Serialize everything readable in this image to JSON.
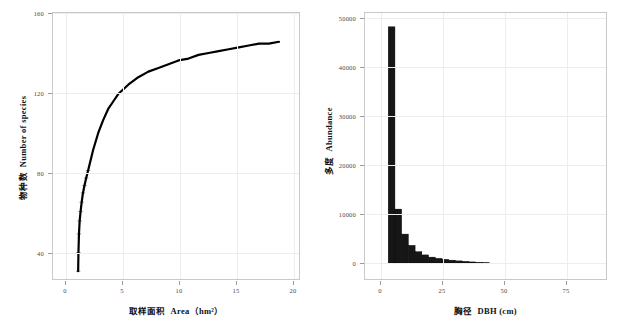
{
  "figure": {
    "background": "#ffffff",
    "axis_color": "#c9c9c9",
    "grid_color": "#ededed",
    "ink_color": "#000000"
  },
  "panels": [
    {
      "id": "species-area-curve",
      "axis_title_x_cjk": "取样面积",
      "axis_title_x_latin": "Area（hm²）",
      "axis_title_y_cjk": "物种数",
      "axis_title_y_latin": "Number of species",
      "y_ticklabels": [
        "160",
        "120",
        "80",
        "40"
      ],
      "x_ticklabels": [
        "0",
        "5",
        "10",
        "15",
        "20"
      ]
    },
    {
      "id": "dbh-abundance-histogram",
      "axis_title_x_cjk": "胸径",
      "axis_title_x_latin": "DBH (cm)",
      "axis_title_y_cjk": "多度",
      "axis_title_y_latin": "Abundance",
      "y_ticklabels": [
        "50000",
        "40000",
        "30000",
        "20000",
        "10000",
        "0"
      ],
      "x_ticklabels": [
        "0",
        "25",
        "50",
        "75"
      ]
    }
  ],
  "chart_data": [
    {
      "type": "line",
      "title": "",
      "xlabel": "取样面积  Area（hm²）",
      "ylabel": "物种数  Number of species",
      "xlim": [
        -1.2,
        21.5
      ],
      "ylim": [
        28,
        162
      ],
      "xticks": [
        0,
        5,
        10,
        15,
        20
      ],
      "yticks": [
        40,
        80,
        120,
        160
      ],
      "grid": true,
      "legend": "none",
      "series": [
        {
          "name": "Species accumulation",
          "x": [
            0.01,
            0.04,
            0.09,
            0.16,
            0.25,
            0.36,
            0.49,
            0.64,
            0.81,
            1.0,
            1.5,
            2.0,
            2.5,
            3.0,
            3.5,
            4.0,
            5.0,
            6.0,
            7.0,
            8.0,
            9.0,
            10.0,
            11.0,
            12.0,
            13.0,
            14.0,
            15.0,
            16.0,
            17.0,
            18.0,
            19.0,
            20.0
          ],
          "y": [
            30,
            40,
            50,
            57,
            62,
            67,
            72,
            76,
            80,
            84,
            95,
            104,
            111,
            117,
            121,
            125,
            130,
            134,
            137,
            139,
            141,
            143,
            144,
            146,
            147,
            148,
            149,
            150,
            151,
            152,
            152,
            153
          ]
        }
      ]
    },
    {
      "type": "bar",
      "title": "",
      "xlabel": "胸径  DBH (cm)",
      "ylabel": "多度  Abundance",
      "xlim": [
        -2,
        90
      ],
      "ylim": [
        0,
        50000
      ],
      "xticks": [
        0,
        25,
        50,
        75
      ],
      "yticks": [
        0,
        10000,
        20000,
        30000,
        40000,
        50000
      ],
      "grid": true,
      "legend": "none",
      "bin_width": 2.8,
      "categories": [
        "1.0-3.8",
        "3.8-6.6",
        "6.6-9.4",
        "9.4-12.2",
        "12.2-15.0",
        "15.0-17.8",
        "17.8-20.6",
        "20.6-23.4",
        "23.4-26.2",
        "26.2-29.0",
        "29.0-31.8",
        "31.8-34.6",
        "34.6-37.4",
        "37.4-40.2",
        "40.2-43.0"
      ],
      "x": [
        2.4,
        5.2,
        8.0,
        10.8,
        13.6,
        16.4,
        19.2,
        22.0,
        24.8,
        27.6,
        30.4,
        33.2,
        36.0,
        38.8,
        41.6
      ],
      "values": [
        48200,
        11000,
        5900,
        3600,
        2300,
        1650,
        1200,
        950,
        750,
        580,
        430,
        330,
        220,
        130,
        60
      ]
    }
  ]
}
